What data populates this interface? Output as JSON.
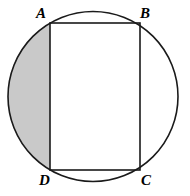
{
  "figure": {
    "type": "geometry-diagram",
    "background_color": "#ffffff",
    "stroke_color": "#1a1a1a",
    "shaded_region_color": "#c9c9c9",
    "labels": {
      "a": "A",
      "b": "B",
      "c": "C",
      "d": "D"
    },
    "circle": {
      "center_x": 93,
      "center_y": 96.5,
      "radius": 85,
      "stroke_width": 1.6
    },
    "rectangle": {
      "left": 50,
      "top": 23,
      "right": 140,
      "bottom": 170,
      "stroke_width": 1.6,
      "fill": "#ffffff"
    },
    "shaded_segment": {
      "chord": "AD",
      "side": "left",
      "chord_x": 50,
      "chord_top_y": 23,
      "chord_bottom_y": 170
    }
  }
}
